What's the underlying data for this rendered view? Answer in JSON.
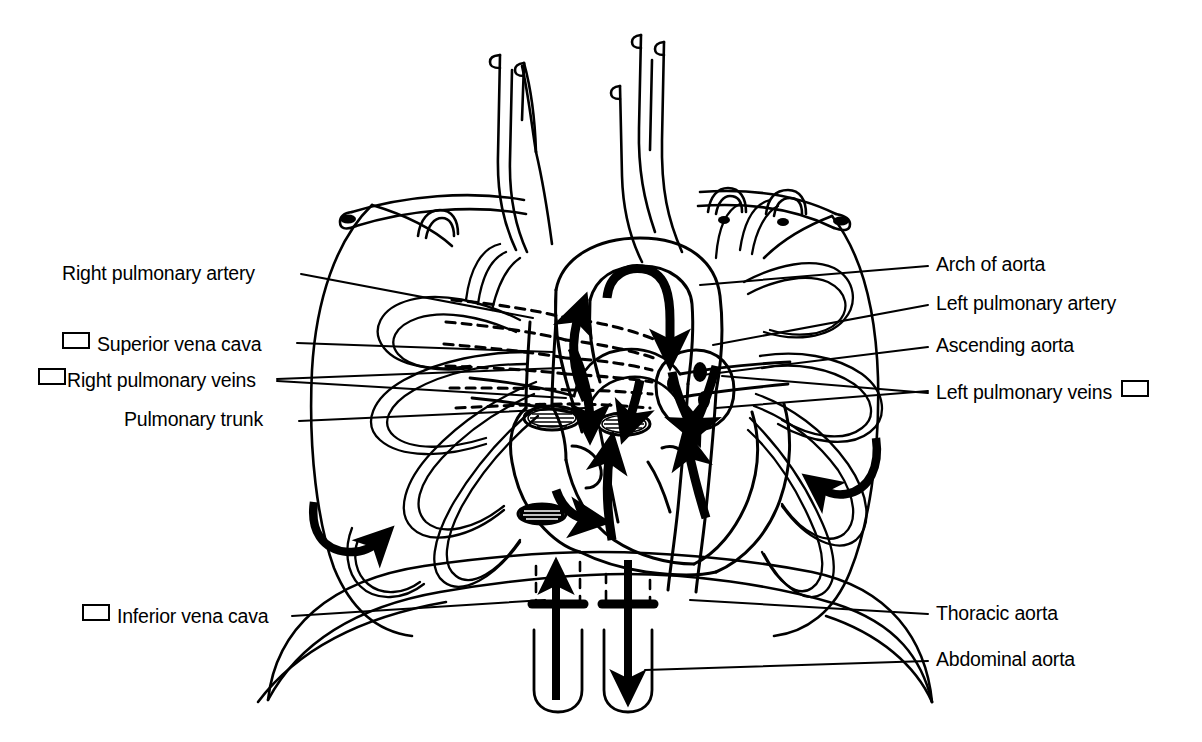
{
  "figure": {
    "style": "black-and-white line drawing",
    "ink_color": "#000000",
    "background_color": "#ffffff"
  },
  "labels_left": [
    {
      "id": "right-pulmonary-artery",
      "text": "Right pulmonary artery",
      "checkbox": "none",
      "x": 62,
      "y": 264,
      "leader_from": [
        301,
        274
      ],
      "leader_to": [
        533,
        318
      ]
    },
    {
      "id": "superior-vena-cava",
      "text": "Superior vena cava",
      "checkbox": "before",
      "x": 62,
      "y": 332,
      "leader_from": [
        297,
        343
      ],
      "leader_to": [
        553,
        352
      ]
    },
    {
      "id": "right-pulmonary-veins",
      "text": "Right pulmonary veins",
      "checkbox": "before",
      "x": 38,
      "y": 368,
      "leader_from": [
        277,
        379
      ],
      "leader_to": [
        561,
        368
      ]
    },
    {
      "id": "pulmonary-trunk",
      "text": "Pulmonary trunk",
      "checkbox": "none",
      "x": 124,
      "y": 410,
      "leader_from": [
        299,
        421
      ],
      "leader_to": [
        585,
        408
      ]
    },
    {
      "id": "inferior-vena-cava",
      "text": "Inferior vena cava",
      "checkbox": "before",
      "x": 82,
      "y": 604,
      "leader_from": [
        292,
        616
      ],
      "leader_to": [
        545,
        600
      ]
    }
  ],
  "labels_right": [
    {
      "id": "arch-of-aorta",
      "text": "Arch of aorta",
      "checkbox": "none",
      "x": 936,
      "y": 255,
      "leader_from": [
        928,
        266
      ],
      "leader_to": [
        700,
        285
      ]
    },
    {
      "id": "left-pulmonary-artery",
      "text": "Left pulmonary artery",
      "checkbox": "none",
      "x": 936,
      "y": 294,
      "leader_from": [
        928,
        305
      ],
      "leader_to": [
        713,
        345
      ]
    },
    {
      "id": "ascending-aorta",
      "text": "Ascending aorta",
      "checkbox": "none",
      "x": 936,
      "y": 336,
      "leader_from": [
        928,
        347
      ],
      "leader_to": [
        702,
        375
      ]
    },
    {
      "id": "left-pulmonary-veins",
      "text": "Left pulmonary veins",
      "checkbox": "after",
      "x": 936,
      "y": 380,
      "leader_from": [
        928,
        391
      ],
      "leader_to": [
        716,
        408
      ]
    },
    {
      "id": "thoracic-aorta",
      "text": "Thoracic aorta",
      "checkbox": "none",
      "x": 936,
      "y": 604,
      "leader_from": [
        928,
        614
      ],
      "leader_to": [
        690,
        600
      ]
    },
    {
      "id": "abdominal-aorta",
      "text": "Abdominal aorta",
      "checkbox": "none",
      "x": 936,
      "y": 650,
      "leader_from": [
        928,
        661
      ],
      "leader_to": [
        645,
        670
      ]
    }
  ],
  "flow_arrows": [
    {
      "id": "arrow-aortic-arch",
      "description": "blood flow over aortic arch, curving down"
    },
    {
      "id": "arrow-ascending-aorta",
      "description": "upward flow in ascending aorta"
    },
    {
      "id": "arrow-svc-down",
      "description": "downward flow in superior vena cava into right atrium"
    },
    {
      "id": "arrow-pulmonary-trunk",
      "description": "upward flow out of right ventricle into pulmonary trunk"
    },
    {
      "id": "arrow-right-atrium",
      "description": "flow from right atrium into right ventricle"
    },
    {
      "id": "arrow-left-atrium",
      "description": "flow from left atrium into left ventricle"
    },
    {
      "id": "arrow-left-ventricle",
      "description": "flow out of left ventricle"
    },
    {
      "id": "arrow-left-lung",
      "description": "curved arrow into left lung field"
    },
    {
      "id": "arrow-right-lung",
      "description": "curved arrow into right lung field"
    },
    {
      "id": "arrow-inferior-vena-cava",
      "description": "upward flow in inferior vena cava through diaphragm"
    },
    {
      "id": "arrow-descending-aorta",
      "description": "downward flow in descending aorta through diaphragm"
    }
  ]
}
